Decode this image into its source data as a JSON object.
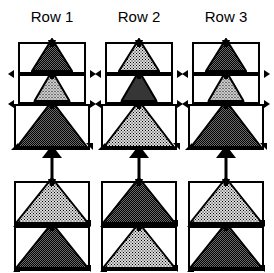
{
  "figure": {
    "kind": "triangle-row-diagram",
    "columns": [
      {
        "label": "Row 1",
        "top_group": {
          "cells": [
            {
              "fill": "dark",
              "triangle_width_ratio": 0.62
            },
            {
              "fill": "light",
              "triangle_width_ratio": 0.55
            },
            {
              "fill": "dark",
              "triangle_width_ratio": 0.95
            }
          ]
        },
        "arrow": {
          "direction": "up"
        },
        "bottom_group": {
          "cells": [
            {
              "fill": "light",
              "triangle_width_ratio": 0.98
            },
            {
              "fill": "dark",
              "triangle_width_ratio": 0.98
            }
          ]
        }
      },
      {
        "label": "Row 2",
        "top_group": {
          "cells": [
            {
              "fill": "light",
              "triangle_width_ratio": 0.62
            },
            {
              "fill": "dark",
              "triangle_width_ratio": 0.55
            },
            {
              "fill": "light",
              "triangle_width_ratio": 0.95
            }
          ]
        },
        "arrow": {
          "direction": "up"
        },
        "bottom_group": {
          "cells": [
            {
              "fill": "dark",
              "triangle_width_ratio": 0.98
            },
            {
              "fill": "light",
              "triangle_width_ratio": 0.98
            }
          ]
        }
      },
      {
        "label": "Row 3",
        "top_group": {
          "cells": [
            {
              "fill": "dark",
              "triangle_width_ratio": 0.62
            },
            {
              "fill": "light",
              "triangle_width_ratio": 0.55
            },
            {
              "fill": "dark",
              "triangle_width_ratio": 0.95
            }
          ]
        },
        "arrow": {
          "direction": "up"
        },
        "bottom_group": {
          "cells": [
            {
              "fill": "light",
              "triangle_width_ratio": 0.98
            },
            {
              "fill": "dark",
              "triangle_width_ratio": 0.98
            }
          ]
        }
      }
    ],
    "geometry": {
      "column_left": [
        14,
        101,
        188
      ],
      "column_width": 76,
      "top_group_top": 42,
      "top_cell_heights": [
        32,
        30,
        46
      ],
      "bottom_group_top": 181,
      "bottom_cell_heights": [
        45,
        45
      ],
      "arrow_top": 145,
      "arrow_height": 35
    },
    "colors": {
      "stroke": "#000000",
      "background": "#ffffff",
      "fill_dark": "#4d4d4d",
      "fill_light": "#e0e0e0"
    }
  }
}
